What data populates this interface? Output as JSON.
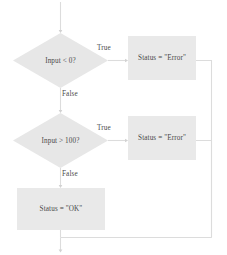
{
  "diagram": {
    "colors": {
      "shape_fill": "#e7e7e7",
      "shape_fill_alt": "#e9e9e9",
      "connector": "#dcdcdc",
      "text": "#4a4a4a",
      "background": "#ffffff"
    },
    "nodes": [
      {
        "id": "decision-input-negative",
        "shape": "diamond",
        "text": "Input < 0?"
      },
      {
        "id": "process-error-negative",
        "shape": "rectangle",
        "text": "Status = \"Error\""
      },
      {
        "id": "decision-input-over-100",
        "shape": "diamond",
        "text": "Input > 100?"
      },
      {
        "id": "process-error-over-100",
        "shape": "rectangle",
        "text": "Status = \"Error\""
      },
      {
        "id": "process-status-ok",
        "shape": "rectangle",
        "text": "Status = \"OK\""
      }
    ],
    "edge_labels": {
      "true_1": "True",
      "false_1": "False",
      "true_2": "True",
      "false_2": "False"
    }
  }
}
